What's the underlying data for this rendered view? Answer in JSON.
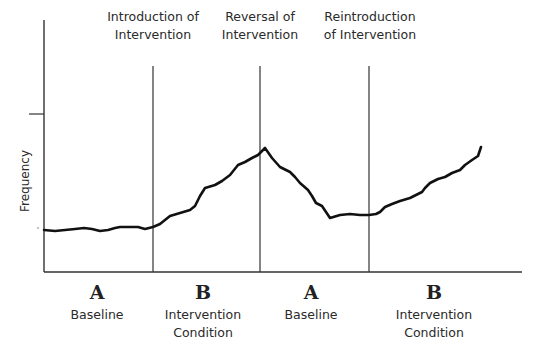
{
  "chart_data": {
    "type": "line",
    "title": "",
    "ylabel": "Frequency",
    "xlabel": "",
    "grid": false,
    "legend": null,
    "phase_change_annotations": [
      {
        "label": "Introduction of Intervention",
        "line1": "Introduction of",
        "line2": "Intervention",
        "x_px": 153
      },
      {
        "label": "Reversal of Intervention",
        "line1": "Reversal of",
        "line2": "Intervention",
        "x_px": 260
      },
      {
        "label": "Reintroduction of Intervention",
        "line1": "Reintroduction",
        "line2": "of Intervention",
        "x_px": 369
      }
    ],
    "phases": [
      {
        "letter": "A",
        "name": "Baseline",
        "name2": ""
      },
      {
        "letter": "B",
        "name": "Intervention",
        "name2": "Condition"
      },
      {
        "letter": "A",
        "name": "Baseline",
        "name2": ""
      },
      {
        "letter": "B",
        "name": "Intervention",
        "name2": "Condition"
      }
    ],
    "series": [
      {
        "name": "Frequency",
        "description": "Flat baseline, rises during intervention, falls after reversal, rises again after reintroduction",
        "points_px": [
          [
            44,
            230
          ],
          [
            55,
            231
          ],
          [
            65,
            230
          ],
          [
            75,
            229
          ],
          [
            84,
            228
          ],
          [
            92,
            229
          ],
          [
            100,
            231
          ],
          [
            108,
            230
          ],
          [
            115,
            228
          ],
          [
            120,
            227
          ],
          [
            130,
            227
          ],
          [
            138,
            227
          ],
          [
            145,
            229
          ],
          [
            153,
            227
          ],
          [
            160,
            224
          ],
          [
            165,
            220
          ],
          [
            170,
            216
          ],
          [
            180,
            213
          ],
          [
            190,
            210
          ],
          [
            195,
            206
          ],
          [
            200,
            196
          ],
          [
            205,
            188
          ],
          [
            215,
            185
          ],
          [
            222,
            181
          ],
          [
            230,
            175
          ],
          [
            238,
            165
          ],
          [
            245,
            162
          ],
          [
            252,
            158
          ],
          [
            258,
            155
          ],
          [
            265,
            148
          ],
          [
            272,
            158
          ],
          [
            280,
            167
          ],
          [
            290,
            172
          ],
          [
            295,
            177
          ],
          [
            300,
            183
          ],
          [
            308,
            190
          ],
          [
            312,
            196
          ],
          [
            316,
            203
          ],
          [
            322,
            206
          ],
          [
            326,
            212
          ],
          [
            330,
            218
          ],
          [
            340,
            215
          ],
          [
            350,
            214
          ],
          [
            360,
            215
          ],
          [
            369,
            215
          ],
          [
            376,
            214
          ],
          [
            380,
            212
          ],
          [
            385,
            207
          ],
          [
            392,
            204
          ],
          [
            400,
            201
          ],
          [
            410,
            198
          ],
          [
            418,
            194
          ],
          [
            422,
            192
          ],
          [
            425,
            188
          ],
          [
            430,
            183
          ],
          [
            438,
            179
          ],
          [
            445,
            177
          ],
          [
            452,
            173
          ],
          [
            460,
            170
          ],
          [
            465,
            165
          ],
          [
            472,
            160
          ],
          [
            478,
            156
          ],
          [
            481,
            147
          ]
        ]
      }
    ],
    "axes": {
      "y_axis_top_px": 20,
      "x_axis_y_px": 272,
      "y_tick_px": 114,
      "x_axis_end_px": 522
    }
  }
}
